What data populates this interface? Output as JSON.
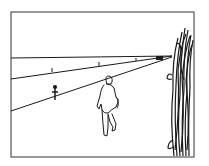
{
  "illustration": {
    "description": "Line drawing: a person walking along a road toward a tall hedge/bush at right; small figure and distant vehicle on the road",
    "stroke_color": "#1a1a1a",
    "background_color": "#ffffff",
    "frame": {
      "x": 11,
      "y": 12,
      "width": 183,
      "height": 145
    },
    "elements": [
      "frame",
      "horizon-line",
      "road-edge-far",
      "road-edge-near",
      "distance-markers",
      "distant-vehicle",
      "small-figure",
      "walking-person",
      "hedge"
    ]
  }
}
